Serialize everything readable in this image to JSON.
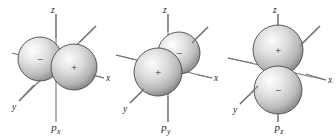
{
  "figure": {
    "background_color": "#ffffff",
    "axis_color": "#6e6e6e",
    "lobe_outline_color": "#4a4a4a",
    "lobe_fill_light": "#fdfdfd",
    "lobe_fill_mid": "#c9c9c9",
    "lobe_fill_dark": "#8d8d8d",
    "sign_color": "#333333"
  },
  "orbitals": [
    {
      "id": "px",
      "caption": "p",
      "caption_sub": "x",
      "axes": [
        {
          "name": "z",
          "label": "z"
        },
        {
          "name": "x",
          "label": "x"
        },
        {
          "name": "y",
          "label": "y"
        }
      ],
      "lobes": [
        {
          "name": "negative-lobe",
          "sign": "−",
          "position": "left"
        },
        {
          "name": "positive-lobe",
          "sign": "+",
          "position": "right"
        }
      ]
    },
    {
      "id": "py",
      "caption": "p",
      "caption_sub": "y",
      "axes": [
        {
          "name": "z",
          "label": "z"
        },
        {
          "name": "x",
          "label": "x"
        },
        {
          "name": "y",
          "label": "y"
        }
      ],
      "lobes": [
        {
          "name": "positive-lobe",
          "sign": "+",
          "position": "front-left"
        },
        {
          "name": "negative-lobe",
          "sign": "−",
          "position": "back-right"
        }
      ]
    },
    {
      "id": "pz",
      "caption": "p",
      "caption_sub": "z",
      "axes": [
        {
          "name": "z",
          "label": "z"
        },
        {
          "name": "x",
          "label": "x"
        },
        {
          "name": "y",
          "label": "y"
        }
      ],
      "lobes": [
        {
          "name": "positive-lobe",
          "sign": "+",
          "position": "top"
        },
        {
          "name": "negative-lobe",
          "sign": "−",
          "position": "bottom"
        }
      ]
    }
  ]
}
